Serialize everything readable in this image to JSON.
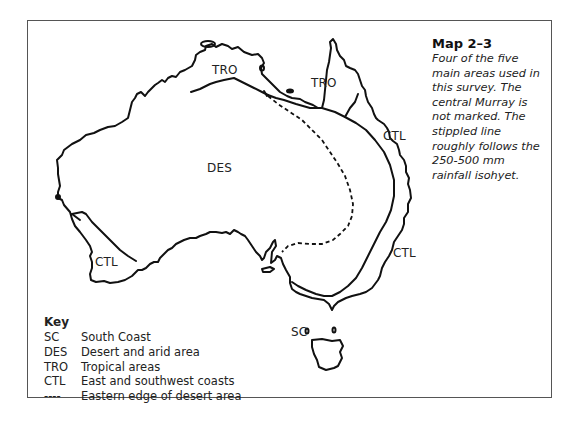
{
  "caption": {
    "title": "Map 2–3",
    "text": "Four of the five main areas used in this survey. The central Murray is not marked. The stippled line roughly follows the 250-500 mm rainfall isohyet."
  },
  "regions": {
    "des": "DES",
    "tro_north": "TRO",
    "tro_cape": "TRO",
    "ctl_east_upper": "CTL",
    "ctl_east_lower": "CTL",
    "ctl_southwest": "CTL",
    "sc": "SC"
  },
  "key": {
    "title": "Key",
    "items": [
      {
        "code": "SC",
        "label": "South Coast"
      },
      {
        "code": "DES",
        "label": "Desert and arid area"
      },
      {
        "code": "TRO",
        "label": "Tropical areas"
      },
      {
        "code": "CTL",
        "label": "East and southwest coasts"
      },
      {
        "code": "----",
        "label": "Eastern edge of desert area"
      }
    ]
  }
}
